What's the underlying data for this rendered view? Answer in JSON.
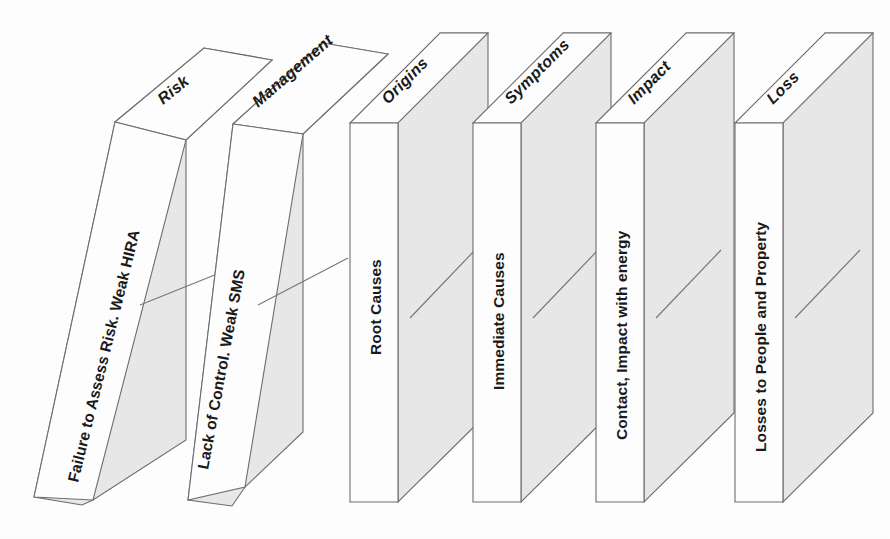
{
  "diagram": {
    "background_color": "#ffffff",
    "face_front_color": "#ffffff",
    "face_side_color": "#e9e9e9",
    "outline_color": "#6e6e6e",
    "text_color": "#1a1a1a",
    "domino_count": 6,
    "dominoes": [
      {
        "index": 1,
        "front_label": "Failure to Assess Risk. Weak HIRA",
        "top_label": "Risk",
        "state": "falling"
      },
      {
        "index": 2,
        "front_label": "Lack of Control. Weak SMS",
        "top_label": "Management",
        "state": "falling"
      },
      {
        "index": 3,
        "front_label": "Root Causes",
        "top_label": "Origins",
        "state": "upright"
      },
      {
        "index": 4,
        "front_label": "Immediate Causes",
        "top_label": "Symptoms",
        "state": "upright"
      },
      {
        "index": 5,
        "front_label": "Contact, Impact with energy",
        "top_label": "Impact",
        "state": "upright"
      },
      {
        "index": 6,
        "front_label": "Losses to People and Property",
        "top_label": "Loss",
        "state": "upright"
      }
    ]
  }
}
